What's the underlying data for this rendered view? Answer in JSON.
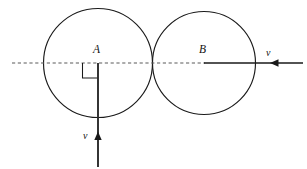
{
  "figure": {
    "type": "geometry-diagram",
    "canvas": {
      "width": 307,
      "height": 169,
      "background": "#ffffff"
    },
    "colors": {
      "stroke": "#1a1a1a",
      "dashed_axis": "#5a5a5a",
      "velocity": "#2b2b2b",
      "background": "#ffffff"
    },
    "labels": {
      "center_left": "A",
      "center_right": "B",
      "velocity_horizontal": "v",
      "velocity_vertical": "v"
    },
    "shapes": {
      "circle_left": {
        "name": "circle-A",
        "cx": 98,
        "cy": 63,
        "r": 54.5
      },
      "circle_right": {
        "name": "circle-B",
        "cx": 204,
        "cy": 63,
        "r": 51.5
      },
      "tangent_point": {
        "x": 152.5,
        "y": 63
      }
    },
    "lines": {
      "dashed_axis": {
        "x1": 12,
        "y1": 63,
        "x2": 205,
        "y2": 63,
        "style": "dashed"
      },
      "solid_axis": {
        "x1": 204,
        "y1": 63,
        "x2": 303,
        "y2": 63,
        "style": "solid"
      },
      "vertical_velocity": {
        "x1": 98,
        "y1": 63,
        "x2": 98,
        "y2": 167,
        "style": "solid"
      }
    },
    "arrows": {
      "horizontal_velocity": {
        "tip_x": 272,
        "tip_y": 63,
        "direction": "left"
      },
      "vertical_velocity": {
        "tip_x": 98,
        "tip_y": 134,
        "direction": "up"
      }
    },
    "angle_marker": {
      "name": "right-angle-at-A",
      "corner_x": 98,
      "corner_y": 63,
      "size": 15,
      "orientation": "lower-left"
    }
  }
}
